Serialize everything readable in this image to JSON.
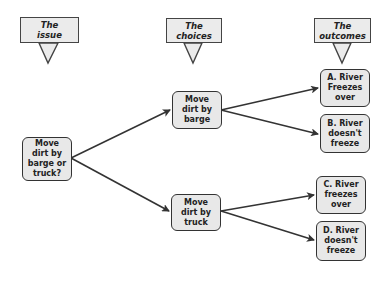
{
  "headers": [
    {
      "id": "issue",
      "label": "The\nissue"
    },
    {
      "id": "choices",
      "label": "The\nchoices"
    },
    {
      "id": "outcomes",
      "label": "The\noutcomes"
    }
  ],
  "nodes": {
    "root": {
      "label": "Move\ndirt by\nbarge or\ntruck?"
    },
    "barge": {
      "label": "Move\ndirt by\nbarge"
    },
    "truck": {
      "label": "Move\ndirt by\ntruck"
    },
    "outcome_a": {
      "label": "A. River\nFreezes\nover"
    },
    "outcome_b": {
      "label": "B. River\ndoesn't\nfreeze"
    },
    "outcome_c": {
      "label": "C. River\nfreezes\nover"
    },
    "outcome_d": {
      "label": "D. River\ndoesn't\nfreeze"
    }
  },
  "edges": [
    {
      "from": "root",
      "to": "barge"
    },
    {
      "from": "root",
      "to": "truck"
    },
    {
      "from": "barge",
      "to": "outcome_a"
    },
    {
      "from": "barge",
      "to": "outcome_b"
    },
    {
      "from": "truck",
      "to": "outcome_c"
    },
    {
      "from": "truck",
      "to": "outcome_d"
    }
  ],
  "colors": {
    "box_fill": "#e8e8e8",
    "stroke": "#333333",
    "background": "#ffffff"
  }
}
